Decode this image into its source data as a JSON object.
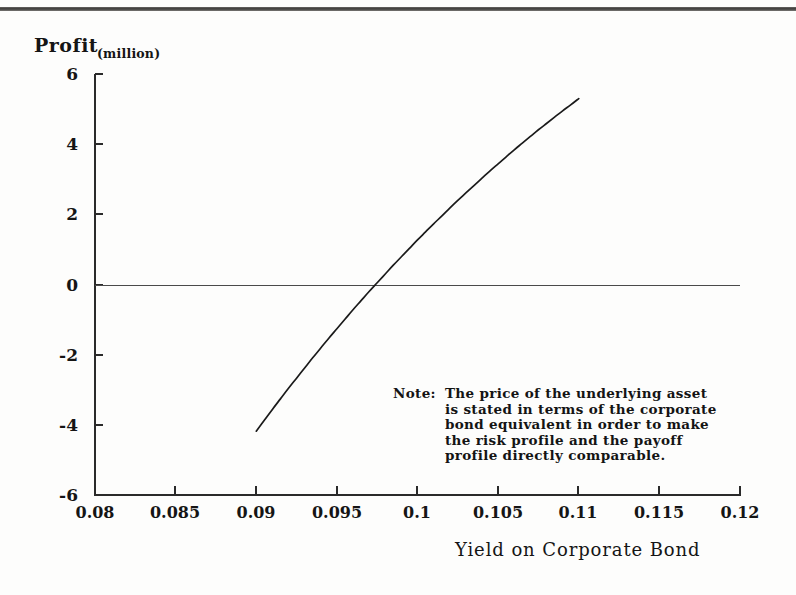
{
  "figure": {
    "background_color": "#fdfdfc",
    "ink_color": "#151515"
  },
  "chart_data": {
    "type": "line",
    "title": "",
    "xlabel": "Yield on Corporate Bond",
    "ylabel": "Profit",
    "ylabel_unit": "(million)",
    "xlim": [
      0.08,
      0.12
    ],
    "ylim": [
      -6,
      6
    ],
    "grid": false,
    "legend": null,
    "zero_line": true,
    "xticks": [
      0.08,
      0.085,
      0.09,
      0.095,
      0.1,
      0.105,
      0.11,
      0.115,
      0.12
    ],
    "xticklabels": [
      "0.08",
      "0.085",
      "0.09",
      "0.095",
      "0.1",
      "0.105",
      "0.11",
      "0.115",
      "0.12"
    ],
    "yticks": [
      6,
      4,
      2,
      0,
      -2,
      -4,
      -6
    ],
    "yticklabels": [
      "6",
      "4",
      "2",
      "0",
      "-2",
      "-4",
      "-6"
    ],
    "series": [
      {
        "name": "Profit",
        "color": "#1a1a1a",
        "x": [
          0.09,
          0.0905,
          0.091,
          0.0915,
          0.092,
          0.0925,
          0.093,
          0.0935,
          0.094,
          0.0945,
          0.095,
          0.0955,
          0.096,
          0.0965,
          0.097,
          0.0975,
          0.098,
          0.0985,
          0.099,
          0.0995,
          0.1,
          0.1005,
          0.101,
          0.1015,
          0.102,
          0.1025,
          0.103,
          0.1035,
          0.104,
          0.1045,
          0.105,
          0.1055,
          0.106,
          0.1065,
          0.107,
          0.1075,
          0.108,
          0.1085,
          0.109,
          0.1095,
          0.11
        ],
        "y": [
          -4.18,
          -3.87,
          -3.56,
          -3.26,
          -2.96,
          -2.67,
          -2.38,
          -2.09,
          -1.81,
          -1.53,
          -1.26,
          -0.99,
          -0.72,
          -0.46,
          -0.2,
          0.05,
          0.3,
          0.55,
          0.79,
          1.03,
          1.27,
          1.5,
          1.73,
          1.95,
          2.18,
          2.4,
          2.61,
          2.82,
          3.03,
          3.24,
          3.44,
          3.64,
          3.84,
          4.03,
          4.22,
          4.41,
          4.59,
          4.77,
          4.95,
          5.12,
          5.3
        ]
      }
    ],
    "annotations": [
      {
        "name": "note",
        "label": "Note:",
        "text": "The price of the underlying asset\nis stated in terms of the corporate\nbond equivalent in order to make\nthe risk profile and the payoff\nprofile directly comparable.",
        "x": 0.0985,
        "y": -2.9
      }
    ]
  }
}
